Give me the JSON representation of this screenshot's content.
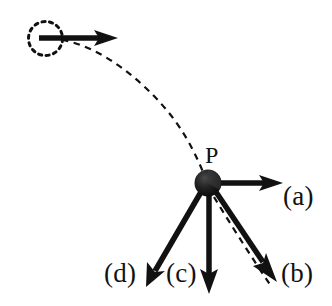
{
  "figure": {
    "background_color": "#ffffff",
    "stroke_color": "#111111",
    "width": 332,
    "height": 306
  },
  "labels": {
    "point_P": "P",
    "choice_a": "(a)",
    "choice_b": "(b)",
    "choice_c": "(c)",
    "choice_d": "(d)"
  },
  "objects": {
    "launch_marker": {
      "name": "dashed-circle-initial-position",
      "center_x": 45.5,
      "center_y": 38.5,
      "radius": 17,
      "style": "dashed",
      "dash_pattern": "3 4"
    },
    "initial_velocity_arrow": {
      "name": "initial-velocity-arrow",
      "from_x": 39,
      "from_y": 38,
      "to_x": 118,
      "to_y": 38,
      "direction": "right",
      "style": "solid"
    },
    "ball_at_P": {
      "name": "ball-at-point-p",
      "center_x": 208,
      "center_y": 183,
      "radius": 13,
      "fill": "#1a1a1a",
      "style": "shaded-sphere"
    },
    "trajectory_path": {
      "name": "dashed-trajectory-curve",
      "style": "dashed",
      "dash_pattern": "6 5",
      "start_x": 62,
      "start_y": 40,
      "end_x": 203,
      "end_y": 172
    },
    "trajectory_continuation": {
      "name": "dashed-trajectory-continuation",
      "style": "dashed",
      "dash_pattern": "6 5",
      "start_x": 214,
      "start_y": 196,
      "end_x": 271,
      "end_y": 286
    }
  },
  "choice_arrows": [
    {
      "id": "a",
      "name": "choice-arrow-a",
      "from_x": 216,
      "from_y": 183,
      "to_x": 282,
      "to_y": 183,
      "direction": "right",
      "angle_deg": 0
    },
    {
      "id": "b",
      "name": "choice-arrow-b",
      "from_x": 215,
      "from_y": 193,
      "to_x": 276,
      "to_y": 281,
      "direction": "down-right",
      "angle_deg": -55
    },
    {
      "id": "c",
      "name": "choice-arrow-c",
      "from_x": 209,
      "from_y": 196,
      "to_x": 209,
      "to_y": 292,
      "direction": "down",
      "angle_deg": -90
    },
    {
      "id": "d",
      "name": "choice-arrow-d",
      "from_x": 200,
      "from_y": 194,
      "to_x": 146,
      "to_y": 287,
      "direction": "down-left",
      "angle_deg": -120
    }
  ]
}
